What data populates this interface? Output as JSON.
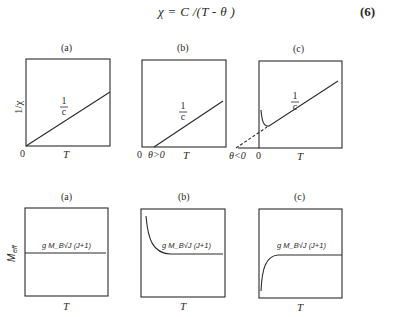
{
  "equation": {
    "text": "χ = C /(T - θ )",
    "number": "(6)"
  },
  "top_row": {
    "y_axis_label": "1/χ",
    "panels": [
      {
        "label": "(a)",
        "curve_label_num": "1",
        "curve_label_den": "c",
        "origin_label": "0",
        "x_label": "T"
      },
      {
        "label": "(b)",
        "curve_label_num": "1",
        "curve_label_den": "c",
        "origin_label": "0",
        "theta_label": "θ>0",
        "x_label": "T"
      },
      {
        "label": "(c)",
        "curve_label_num": "1",
        "curve_label_den": "c",
        "origin_label": "0",
        "theta_label": "θ<0",
        "x_label": "T"
      }
    ]
  },
  "bottom_row": {
    "y_axis_label": "M_eff",
    "y_axis_main": "M",
    "y_axis_sub": "eff",
    "panels": [
      {
        "label": "(a)",
        "line_label": "g M_B√J (J+1)",
        "x_label": "T"
      },
      {
        "label": "(b)",
        "line_label": "g M_B√J (J+1)",
        "x_label": "T"
      },
      {
        "label": "(c)",
        "line_label": "g M_B√J (J+1)",
        "x_label": "T"
      }
    ]
  },
  "colors": {
    "ink": "#2a2a2a",
    "background": "#ffffff"
  }
}
